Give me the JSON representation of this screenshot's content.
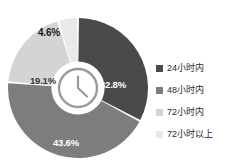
{
  "chart_data": {
    "type": "pie",
    "variant": "donut",
    "title": "",
    "subtitle": "",
    "xlabel": "",
    "ylabel": "",
    "grid": false,
    "legend_position": "right",
    "start_angle_deg": 0,
    "direction": "clockwise",
    "inner_radius_ratio": 0.38,
    "slice_gap_deg": 1.6,
    "categories": [
      "24小时内",
      "48小时内",
      "72小时内",
      "72小时以上"
    ],
    "values": [
      32.8,
      43.6,
      19.1,
      4.6
    ],
    "value_unit": "%",
    "data_labels": [
      "32.8%",
      "43.6%",
      "19.1%",
      "4.6%"
    ],
    "colors": [
      "#4a4a4a",
      "#7d7d7d",
      "#d4d4d4",
      "#e9e9e9"
    ],
    "label_text_colors": [
      "#ffffff",
      "#ffffff",
      "#3a3a3a",
      "#1a1a1a"
    ],
    "background": "#ffffff",
    "separator_color": "#ffffff"
  },
  "center": {
    "icon": "clock-icon",
    "icon_color": "#9a9a9a",
    "hole_fill": "#ffffff"
  },
  "labels": {
    "slice_24h": "32.8%",
    "slice_48h": "43.6%",
    "slice_72h": "19.1%",
    "slice_over72h": "4.6%"
  },
  "legend": {
    "items": [
      {
        "label": "24小时内",
        "color": "#4a4a4a"
      },
      {
        "label": "48小时内",
        "color": "#7d7d7d"
      },
      {
        "label": "72小时内",
        "color": "#d4d4d4"
      },
      {
        "label": "72小时以上",
        "color": "#e9e9e9"
      }
    ]
  }
}
